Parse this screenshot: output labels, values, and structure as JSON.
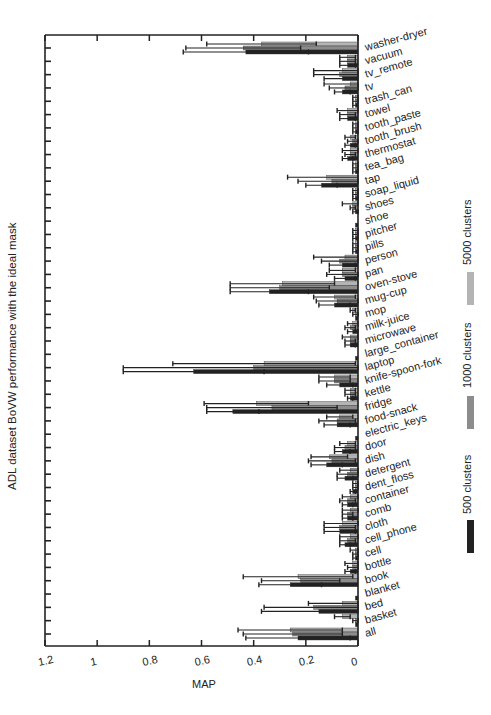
{
  "chart_data": {
    "type": "bar",
    "orientation": "horizontal",
    "title": "ADL dataset BoVW performance with the ideal mask",
    "xlabel": "MAP",
    "ylabel": "ADL dataset BoVW performance with the ideal mask",
    "xlim": [
      1.2,
      0
    ],
    "x_reversed": true,
    "x_ticks": [
      1.2,
      1,
      0.8,
      0.6,
      0.4,
      0.2,
      0
    ],
    "x_tick_labels": [
      "1.2",
      "1",
      "0.8",
      "0.6",
      "0.4",
      "0.2",
      "0"
    ],
    "grid": false,
    "legend_position": "right",
    "categories": [
      "washer-dryer",
      "vacuum",
      "tv_remote",
      "tv",
      "trash_can",
      "towel",
      "tooth_paste",
      "tooth_brush",
      "thermostat",
      "tea_bag",
      "tap",
      "soap_liquid",
      "shoes",
      "shoe",
      "pitcher",
      "pills",
      "person",
      "pan",
      "oven-stove",
      "mug-cup",
      "mop",
      "milk-juice",
      "microwave",
      "large_container",
      "laptop",
      "knife-spoon-fork",
      "kettle",
      "fridge",
      "food-snack",
      "electric_keys",
      "door",
      "dish",
      "detergent",
      "dent_floss",
      "container",
      "comb",
      "cloth",
      "cell_phone",
      "cell",
      "bottle",
      "book",
      "blanket",
      "bed",
      "basket",
      "all"
    ],
    "series": [
      {
        "name": "5000 clusters",
        "color": "#b4b4b4",
        "values": [
          0.37,
          0.04,
          0.06,
          0.03,
          0.01,
          0.04,
          0.01,
          0.03,
          0.03,
          0.01,
          0.12,
          0.01,
          0.02,
          0.0,
          0.01,
          0.01,
          0.05,
          0.06,
          0.29,
          0.09,
          0.02,
          0.02,
          0.03,
          0.0,
          0.36,
          0.09,
          0.03,
          0.39,
          0.07,
          0.0,
          0.04,
          0.11,
          0.03,
          0.01,
          0.03,
          0.03,
          0.06,
          0.03,
          0.01,
          0.02,
          0.23,
          0.0,
          0.06,
          0.06,
          0.26
        ],
        "errors": [
          0.21,
          0.03,
          0.11,
          0.1,
          0.01,
          0.04,
          0.01,
          0.02,
          0.03,
          0.01,
          0.15,
          0.01,
          0.04,
          0.0,
          0.01,
          0.01,
          0.12,
          0.05,
          0.2,
          0.08,
          0.01,
          0.02,
          0.03,
          0.0,
          0.35,
          0.06,
          0.02,
          0.2,
          0.05,
          0.0,
          0.03,
          0.07,
          0.04,
          0.01,
          0.03,
          0.03,
          0.07,
          0.04,
          0.02,
          0.03,
          0.21,
          0.0,
          0.13,
          0.03,
          0.2
        ]
      },
      {
        "name": "1000 clusters",
        "color": "#8c8c8c",
        "values": [
          0.44,
          0.04,
          0.07,
          0.05,
          0.01,
          0.04,
          0.01,
          0.02,
          0.03,
          0.01,
          0.1,
          0.01,
          0.02,
          0.0,
          0.01,
          0.01,
          0.07,
          0.06,
          0.3,
          0.08,
          0.01,
          0.03,
          0.03,
          0.0,
          0.4,
          0.09,
          0.03,
          0.33,
          0.08,
          0.0,
          0.05,
          0.1,
          0.04,
          0.01,
          0.04,
          0.04,
          0.07,
          0.04,
          0.01,
          0.02,
          0.22,
          0.0,
          0.17,
          0.01,
          0.25
        ],
        "errors": [
          0.22,
          0.03,
          0.1,
          0.06,
          0.01,
          0.03,
          0.01,
          0.02,
          0.02,
          0.01,
          0.13,
          0.01,
          0.01,
          0.0,
          0.01,
          0.01,
          0.07,
          0.06,
          0.19,
          0.08,
          0.01,
          0.02,
          0.02,
          0.0,
          0.5,
          0.06,
          0.02,
          0.25,
          0.07,
          0.0,
          0.04,
          0.09,
          0.04,
          0.01,
          0.03,
          0.02,
          0.06,
          0.03,
          0.01,
          0.02,
          0.15,
          0.0,
          0.19,
          0.01,
          0.19
        ]
      },
      {
        "name": "500 clusters",
        "color": "#222222",
        "values": [
          0.43,
          0.04,
          0.06,
          0.06,
          0.01,
          0.04,
          0.01,
          0.03,
          0.04,
          0.01,
          0.14,
          0.01,
          0.01,
          0.01,
          0.01,
          0.01,
          0.06,
          0.05,
          0.34,
          0.09,
          0.01,
          0.02,
          0.03,
          0.01,
          0.63,
          0.07,
          0.03,
          0.48,
          0.08,
          0.01,
          0.06,
          0.12,
          0.05,
          0.02,
          0.04,
          0.04,
          0.07,
          0.05,
          0.01,
          0.03,
          0.26,
          0.01,
          0.15,
          0.01,
          0.23
        ],
        "errors": [
          0.24,
          0.03,
          0.07,
          0.03,
          0.01,
          0.03,
          0.01,
          0.02,
          0.02,
          0.01,
          0.06,
          0.01,
          0.01,
          0.0,
          0.01,
          0.01,
          0.05,
          0.04,
          0.15,
          0.06,
          0.0,
          0.02,
          0.02,
          0.0,
          0.27,
          0.05,
          0.01,
          0.1,
          0.05,
          0.0,
          0.03,
          0.06,
          0.03,
          0.01,
          0.02,
          0.02,
          0.06,
          0.02,
          0.01,
          0.02,
          0.12,
          0.0,
          0.22,
          0.0,
          0.2
        ]
      }
    ]
  },
  "legend": {
    "items": [
      {
        "label": "5000 clusters",
        "color": "#b4b4b4"
      },
      {
        "label": "1000 clusters",
        "color": "#8c8c8c"
      },
      {
        "label": "500 clusters",
        "color": "#222222"
      }
    ]
  }
}
